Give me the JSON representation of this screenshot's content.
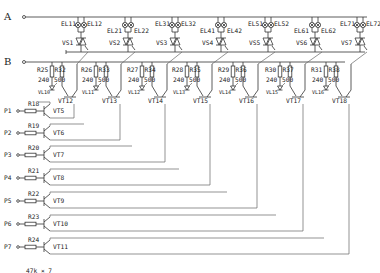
{
  "rails": {
    "A": "A",
    "B": "B"
  },
  "lamp_pairs": [
    {
      "left": "EL11",
      "right": "EL12",
      "triac": "VS1"
    },
    {
      "left": "EL21",
      "right": "EL22",
      "triac": "VS2"
    },
    {
      "left": "EL31",
      "right": "EL32",
      "triac": "VS3"
    },
    {
      "left": "EL41",
      "right": "EL42",
      "triac": "VS4"
    },
    {
      "left": "EL51",
      "right": "EL52",
      "triac": "VS5"
    },
    {
      "left": "EL61",
      "right": "EL62",
      "triac": "VS6"
    },
    {
      "left": "EL71",
      "right": "EL72",
      "triac": "VS7"
    }
  ],
  "driver_stages": [
    {
      "r_led": "R25",
      "r_led_val": "240",
      "r_col": "R32",
      "r_col_val": "500",
      "led": "VL10",
      "transistor": "VT12"
    },
    {
      "r_led": "R26",
      "r_led_val": "240",
      "r_col": "R33",
      "r_col_val": "500",
      "led": "VL11",
      "transistor": "VT13"
    },
    {
      "r_led": "R27",
      "r_led_val": "240",
      "r_col": "R34",
      "r_col_val": "500",
      "led": "VL12",
      "transistor": "VT14"
    },
    {
      "r_led": "R28",
      "r_led_val": "240",
      "r_col": "R35",
      "r_col_val": "500",
      "led": "VL13",
      "transistor": "VT15"
    },
    {
      "r_led": "R29",
      "r_led_val": "240",
      "r_col": "R36",
      "r_col_val": "500",
      "led": "VL14",
      "transistor": "VT16"
    },
    {
      "r_led": "R30",
      "r_led_val": "240",
      "r_col": "R37",
      "r_col_val": "500",
      "led": "VL15",
      "transistor": "VT17"
    },
    {
      "r_led": "R31",
      "r_led_val": "240",
      "r_col": "R38",
      "r_col_val": "500",
      "led": "VL16",
      "transistor": "VT18"
    }
  ],
  "inputs": [
    {
      "port": "P1",
      "resistor": "R18",
      "transistor": "VT5"
    },
    {
      "port": "P2",
      "resistor": "R19",
      "transistor": "VT6"
    },
    {
      "port": "P3",
      "resistor": "R20",
      "transistor": "VT7"
    },
    {
      "port": "P4",
      "resistor": "R21",
      "transistor": "VT8"
    },
    {
      "port": "P5",
      "resistor": "R22",
      "transistor": "VT9"
    },
    {
      "port": "P6",
      "resistor": "R23",
      "transistor": "VT10"
    },
    {
      "port": "P7",
      "resistor": "R24",
      "transistor": "VT11"
    }
  ],
  "input_resistor_value": "47k × 7"
}
